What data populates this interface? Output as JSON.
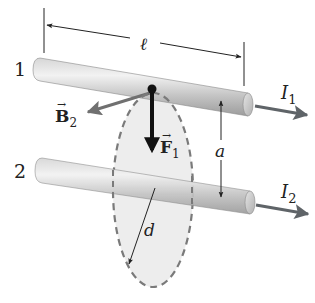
{
  "figure": {
    "wires": [
      {
        "id": "1",
        "label": "1",
        "current_label": "I",
        "current_subscript": "1"
      },
      {
        "id": "2",
        "label": "2",
        "current_label": "I",
        "current_subscript": "2"
      }
    ],
    "length_label": "ℓ",
    "separation_label": "a",
    "radius_label": "d",
    "field_vector": {
      "symbol": "B",
      "subscript": "2",
      "arrow": "→"
    },
    "force_vector": {
      "symbol": "F",
      "subscript": "1",
      "arrow": "→"
    },
    "colors": {
      "rod_light": "#e8e8e8",
      "rod_dark": "#a8a8a8",
      "field_region": "#ededed",
      "dashed_outline": "#7a7a7a",
      "current_arrow": "#5f6468",
      "field_arrow": "#707070",
      "force_arrow": "#111111",
      "dimension_line": "#222222"
    }
  }
}
